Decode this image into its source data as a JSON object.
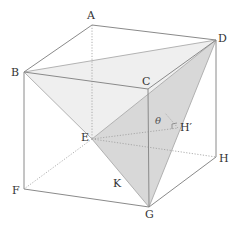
{
  "diagram": {
    "type": "cube-geometry",
    "vertices": {
      "A": {
        "label": "A",
        "x": 92,
        "y": 25
      },
      "B": {
        "label": "B",
        "x": 24,
        "y": 72
      },
      "C": {
        "label": "C",
        "x": 148,
        "y": 89
      },
      "D": {
        "label": "D",
        "x": 216,
        "y": 40
      },
      "E": {
        "label": "E",
        "x": 92,
        "y": 139
      },
      "F": {
        "label": "F",
        "x": 24,
        "y": 189
      },
      "G": {
        "label": "G",
        "x": 149,
        "y": 207
      },
      "H": {
        "label": "H",
        "x": 216,
        "y": 157
      }
    },
    "points": {
      "K": {
        "label": "K"
      },
      "H_prime": {
        "label": "H′"
      }
    },
    "angle_label": "θ",
    "colors": {
      "edge": "#8a8a8a",
      "hidden_edge": "#9a9a9a",
      "face_dark": "#d6d6d6",
      "face_light": "#eeeeee",
      "label": "#333333"
    }
  }
}
